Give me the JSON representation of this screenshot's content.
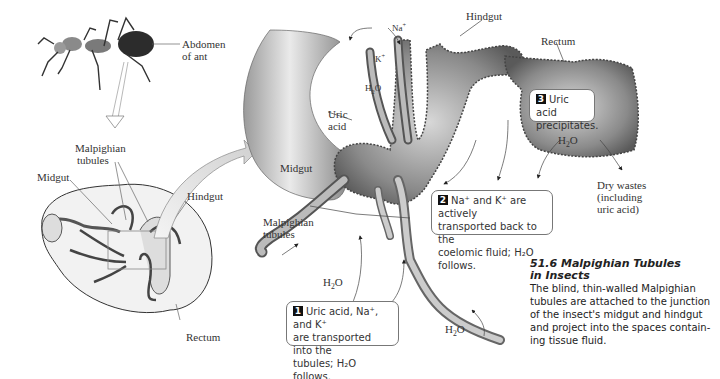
{
  "labels": {
    "abdomen": [
      "Abdomen",
      "of ant"
    ],
    "malpighian_left": [
      "Malpighian",
      "tubules"
    ],
    "midgut_left": "Midgut",
    "hindgut_left": "Hindgut",
    "rectum_left": "Rectum",
    "na": "Na+",
    "k": "K+",
    "h2o_top": "H2O",
    "uric_acid": [
      "Uric",
      "acid"
    ],
    "midgut_right": "Midgut",
    "hindgut_right": "Hindgut",
    "rectum_right": "Rectum",
    "h2o_rectum": "H2O",
    "dry_wastes": [
      "Dry wastes",
      "(including",
      "uric acid)"
    ],
    "malpighian_right": [
      "Malpighian",
      "tubules"
    ],
    "h2o_bottom_left": "H2O",
    "h2o_bottom_right": "H2O"
  },
  "callouts": [
    {
      "number": "1",
      "lines": [
        "Uric acid, Na⁺, and K⁺",
        "are transported into the",
        "tubules; H₂O follows."
      ]
    },
    {
      "number": "2",
      "lines": [
        "Na⁺ and K⁺ are actively",
        "transported back to the",
        "coelomic fluid; H₂O follows."
      ]
    },
    {
      "number": "3",
      "lines": [
        "Uric acid",
        "precipitates."
      ]
    }
  ],
  "caption": {
    "title_line1": "51.6  Malpighian Tubules",
    "title_line2": "in Insects",
    "body": [
      "The blind, thin-walled Malpighian",
      "tubules are attached to the junction",
      "of the insect's midgut and hindgut",
      "and project into the spaces contain-",
      "ing tissue fluid."
    ]
  },
  "colors": {
    "tissue_dark": "#6e6e6e",
    "tissue_light": "#cfcfcf",
    "arrow_fill": "#e6e6e6",
    "line": "#555555"
  }
}
